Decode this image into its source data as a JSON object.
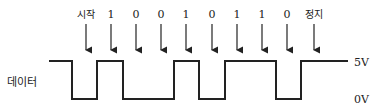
{
  "diagram": {
    "title": "",
    "signal_label": "데이터",
    "levels": {
      "high": "5V",
      "low": "0V"
    },
    "bits": [
      {
        "label": "시작",
        "x": 86
      },
      {
        "label": "1",
        "x": 111
      },
      {
        "label": "0",
        "x": 136
      },
      {
        "label": "0",
        "x": 161
      },
      {
        "label": "1",
        "x": 186
      },
      {
        "label": "0",
        "x": 212
      },
      {
        "label": "1",
        "x": 237
      },
      {
        "label": "1",
        "x": 262
      },
      {
        "label": "0",
        "x": 287
      },
      {
        "label": "정지",
        "x": 314
      }
    ],
    "waveform": [
      {
        "x": 49,
        "level": "high"
      },
      {
        "x": 72,
        "level": "low"
      },
      {
        "x": 97,
        "level": "high"
      },
      {
        "x": 123,
        "level": "low"
      },
      {
        "x": 174,
        "level": "high"
      },
      {
        "x": 199,
        "level": "low"
      },
      {
        "x": 225,
        "level": "high"
      },
      {
        "x": 276,
        "level": "low"
      },
      {
        "x": 301,
        "level": "high"
      },
      {
        "x": 348,
        "level": "end"
      }
    ],
    "color": "#222222"
  }
}
